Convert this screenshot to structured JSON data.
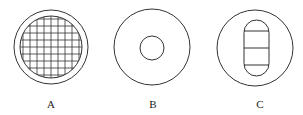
{
  "figures": [
    {
      "label": "A",
      "description": "circle with gridded inner disc"
    },
    {
      "label": "B",
      "description": "circle with small concentric inner circle"
    },
    {
      "label": "C",
      "description": "circle containing capsule divided into segments"
    }
  ],
  "colors": {
    "stroke": "#333333",
    "background": "#ffffff"
  }
}
